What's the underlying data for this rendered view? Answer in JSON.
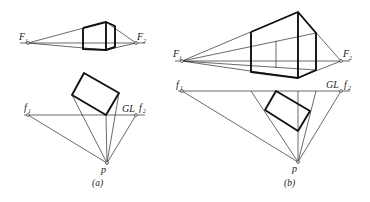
{
  "figure": {
    "panel_a": {
      "caption": "(a)",
      "labels": {
        "F1": "F",
        "F1_sub": "1",
        "F2": "F",
        "F2_sub": "2",
        "f1": "f",
        "f1_sub": "1",
        "f2": "f",
        "f2_sub": "2",
        "GL": "GL",
        "p": "p"
      }
    },
    "panel_b": {
      "caption": "(b)",
      "labels": {
        "F1": "F",
        "F1_sub": "1",
        "F2": "F",
        "F2_sub": "2",
        "f1": "f",
        "f1_sub": "1",
        "f2": "f",
        "f2_sub": "2",
        "GL": "GL",
        "p": "p"
      }
    }
  }
}
